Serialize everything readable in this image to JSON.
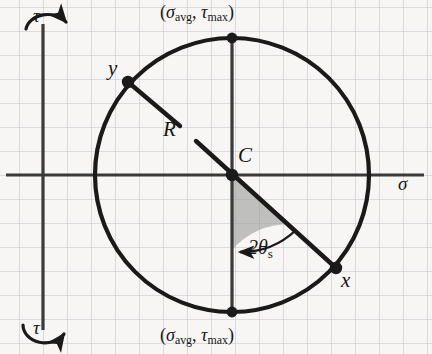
{
  "figure": {
    "background_color": "#f7f6f4",
    "grid_color": "#b9b7c6",
    "curve_color": "#1a1a1a",
    "shade_color": "#9d9d9d"
  },
  "axes": {
    "horizontal_label": "σ",
    "vertical_label_top": "τ",
    "vertical_label_bottom": "τ",
    "origin_px": {
      "x": 43,
      "y": 175
    },
    "grid_spacing_px": 24
  },
  "circle": {
    "center_label": "C",
    "center_px": {
      "x": 232,
      "y": 175
    },
    "radius_px": 137,
    "radius_label": "R"
  },
  "points": [
    {
      "name": "y",
      "label": "y",
      "px": {
        "x": 128,
        "y": 82
      },
      "label_offset": "upper-left"
    },
    {
      "name": "x",
      "label": "x",
      "px": {
        "x": 336,
        "y": 268
      },
      "label_offset": "lower-right"
    },
    {
      "name": "tau-max-top",
      "label": "(σavg, τmax)",
      "label_open_paren": "(",
      "label_sigma": "σ",
      "label_sigma_sub": "avg",
      "label_comma": ", ",
      "label_tau": "τ",
      "label_tau_sub": "max",
      "label_close_paren": ")",
      "px": {
        "x": 232,
        "y": 38
      }
    },
    {
      "name": "tau-max-bottom",
      "label": "(σavg, τmax)",
      "label_open_paren": "(",
      "label_sigma": "σ",
      "label_sigma_sub": "avg",
      "label_comma": ", ",
      "label_tau": "τ",
      "label_tau_sub": "max",
      "label_close_paren": ")",
      "px": {
        "x": 232,
        "y": 312
      }
    },
    {
      "name": "center",
      "label": "C",
      "px": {
        "x": 232,
        "y": 175
      }
    }
  ],
  "angle": {
    "label_value": "2",
    "label_theta": "θ",
    "label_sub": "s",
    "full_label": "2θs",
    "shaded": true,
    "from_deg": 318,
    "to_deg": 270
  }
}
